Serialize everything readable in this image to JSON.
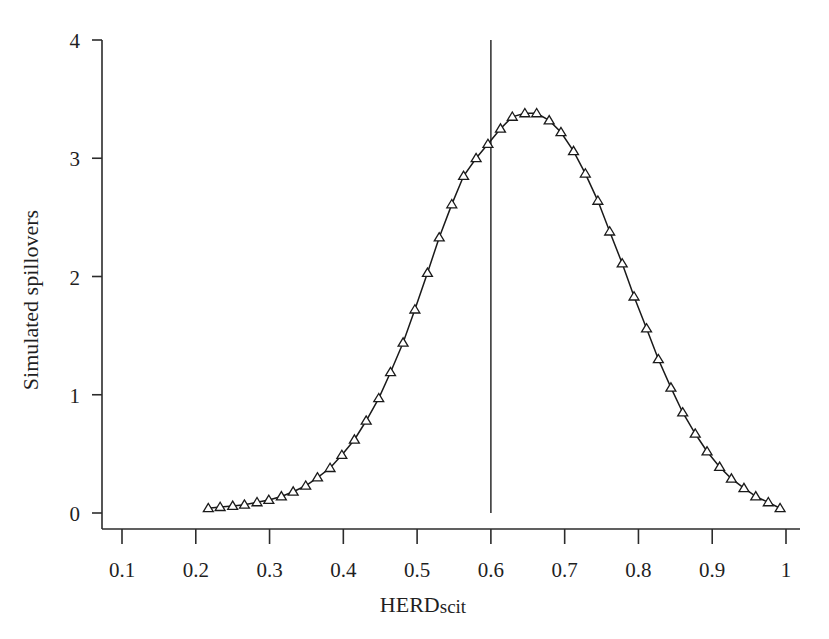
{
  "figure": {
    "background_color": "#ffffff",
    "line_color": "#1a1a1a",
    "marker_shape": "triangle-up",
    "marker_fill": "#ffffff",
    "marker_stroke": "#1a1a1a"
  },
  "chart_data": {
    "type": "line",
    "title": "",
    "subtitle": "",
    "xlabel": "HERDscit",
    "xlabel_main": "HERD",
    "xlabel_suffix": "scit",
    "ylabel": "Simulated spillovers",
    "xlim": [
      0.06,
      1.02
    ],
    "ylim": [
      0,
      4.1
    ],
    "xticks": [
      0.1,
      0.2,
      0.3,
      0.4,
      0.5,
      0.6,
      0.7,
      0.8,
      0.9,
      1
    ],
    "xtick_labels": [
      "0.1",
      "0.2",
      "0.3",
      "0.4",
      "0.5",
      "0.6",
      "0.7",
      "0.8",
      "0.9",
      "1"
    ],
    "yticks": [
      0,
      1,
      2,
      3,
      4
    ],
    "ytick_labels": [
      "0",
      "1",
      "2",
      "3",
      "4"
    ],
    "grid": false,
    "legend": null,
    "legend_position": "none",
    "annotations": [
      {
        "type": "vertical-line",
        "name": "reference-line",
        "x": 0.6,
        "y_from": 0,
        "y_to": 4.0,
        "color": "#2b2b2b"
      }
    ],
    "series": [
      {
        "name": "Simulated spillovers",
        "marker": "triangle-up",
        "x": [
          0.217,
          0.233,
          0.25,
          0.266,
          0.283,
          0.299,
          0.316,
          0.332,
          0.349,
          0.365,
          0.382,
          0.398,
          0.415,
          0.431,
          0.448,
          0.464,
          0.481,
          0.497,
          0.514,
          0.53,
          0.547,
          0.563,
          0.58,
          0.596,
          0.613,
          0.629,
          0.646,
          0.662,
          0.679,
          0.695,
          0.712,
          0.728,
          0.745,
          0.761,
          0.778,
          0.794,
          0.811,
          0.827,
          0.844,
          0.86,
          0.877,
          0.893,
          0.91,
          0.926,
          0.943,
          0.959,
          0.976,
          0.992
        ],
        "values": [
          0.04,
          0.05,
          0.06,
          0.07,
          0.09,
          0.11,
          0.14,
          0.18,
          0.23,
          0.3,
          0.38,
          0.49,
          0.62,
          0.78,
          0.97,
          1.19,
          1.44,
          1.72,
          2.03,
          2.33,
          2.61,
          2.85,
          3.0,
          3.12,
          3.25,
          3.35,
          3.38,
          3.38,
          3.32,
          3.22,
          3.06,
          2.87,
          2.64,
          2.38,
          2.11,
          1.83,
          1.56,
          1.3,
          1.06,
          0.85,
          0.67,
          0.52,
          0.39,
          0.29,
          0.21,
          0.14,
          0.09,
          0.04
        ]
      }
    ]
  },
  "clipped_header": {
    "visible_fragment": ""
  }
}
